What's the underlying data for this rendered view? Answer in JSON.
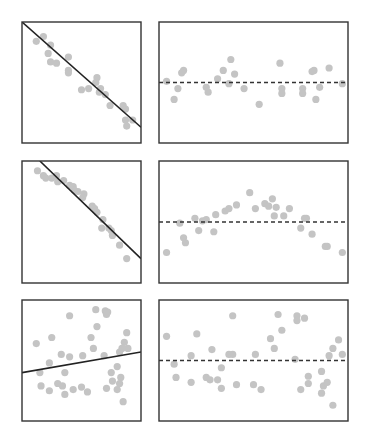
{
  "colors": {
    "point": "#c4c4c4",
    "frame": "#333333",
    "fit_line": "#222222",
    "zero_line": "#333333",
    "background": "#ffffff"
  },
  "chart_data": [
    {
      "type": "scatter",
      "panel": "row1-left",
      "title": "",
      "xlabel": "",
      "ylabel": "",
      "xlim": [
        0,
        10
      ],
      "ylim": [
        0,
        10
      ],
      "grid": false,
      "fit_line": {
        "style": "solid",
        "from": [
          0,
          10
        ],
        "to": [
          10,
          1.3
        ]
      },
      "points": [
        [
          1.2,
          8.4
        ],
        [
          1.8,
          8.8
        ],
        [
          2.4,
          8.1
        ],
        [
          2.2,
          7.4
        ],
        [
          2.4,
          6.7
        ],
        [
          2.9,
          6.6
        ],
        [
          3.9,
          7.1
        ],
        [
          3.9,
          6.0
        ],
        [
          3.9,
          5.8
        ],
        [
          5.0,
          4.4
        ],
        [
          5.6,
          4.5
        ],
        [
          6.3,
          5.4
        ],
        [
          6.2,
          5.0
        ],
        [
          6.6,
          4.5
        ],
        [
          6.5,
          4.2
        ],
        [
          7.0,
          4.0
        ],
        [
          7.4,
          3.1
        ],
        [
          8.5,
          3.1
        ],
        [
          8.7,
          2.8
        ],
        [
          8.7,
          1.9
        ],
        [
          9.3,
          1.9
        ],
        [
          8.8,
          1.4
        ]
      ]
    },
    {
      "type": "scatter",
      "panel": "row1-right",
      "title": "",
      "xlabel": "",
      "ylabel": "",
      "xlim": [
        0,
        10
      ],
      "ylim": [
        0,
        10
      ],
      "grid": false,
      "zero_line": {
        "style": "dashed",
        "y": 5.0
      },
      "points": [
        [
          0.4,
          5.1
        ],
        [
          1.3,
          6.0
        ],
        [
          1.2,
          5.8
        ],
        [
          1.0,
          4.5
        ],
        [
          0.8,
          3.6
        ],
        [
          2.5,
          4.6
        ],
        [
          2.6,
          4.2
        ],
        [
          3.1,
          5.3
        ],
        [
          3.4,
          6.0
        ],
        [
          3.8,
          6.9
        ],
        [
          4.0,
          5.7
        ],
        [
          3.7,
          4.9
        ],
        [
          4.5,
          4.5
        ],
        [
          5.3,
          3.2
        ],
        [
          6.4,
          6.6
        ],
        [
          6.5,
          4.5
        ],
        [
          6.5,
          4.1
        ],
        [
          7.6,
          4.5
        ],
        [
          7.6,
          4.1
        ],
        [
          8.1,
          5.9
        ],
        [
          8.2,
          6.0
        ],
        [
          8.3,
          3.6
        ],
        [
          8.5,
          4.6
        ],
        [
          9.0,
          6.2
        ],
        [
          9.7,
          4.9
        ]
      ]
    },
    {
      "type": "scatter",
      "panel": "row2-left",
      "title": "",
      "xlabel": "",
      "ylabel": "",
      "xlim": [
        0,
        10
      ],
      "ylim": [
        0,
        10
      ],
      "grid": false,
      "fit_line": {
        "style": "solid",
        "from": [
          1.5,
          10
        ],
        "to": [
          10,
          2.0
        ]
      },
      "points": [
        [
          1.3,
          9.2
        ],
        [
          1.8,
          8.8
        ],
        [
          2.0,
          8.6
        ],
        [
          2.5,
          8.6
        ],
        [
          2.9,
          8.8
        ],
        [
          3.0,
          8.3
        ],
        [
          3.5,
          8.4
        ],
        [
          4.0,
          8.0
        ],
        [
          4.3,
          7.9
        ],
        [
          4.4,
          7.6
        ],
        [
          4.7,
          7.5
        ],
        [
          5.2,
          7.3
        ],
        [
          5.1,
          7.0
        ],
        [
          5.9,
          6.3
        ],
        [
          6.1,
          6.1
        ],
        [
          6.3,
          5.8
        ],
        [
          6.8,
          5.2
        ],
        [
          6.7,
          4.5
        ],
        [
          7.3,
          4.5
        ],
        [
          7.5,
          4.3
        ],
        [
          7.6,
          3.9
        ],
        [
          8.2,
          3.1
        ],
        [
          8.8,
          2.0
        ]
      ]
    },
    {
      "type": "scatter",
      "panel": "row2-right",
      "title": "",
      "xlabel": "",
      "ylabel": "",
      "xlim": [
        0,
        10
      ],
      "ylim": [
        0,
        10
      ],
      "grid": false,
      "zero_line": {
        "style": "dashed",
        "y": 5.0
      },
      "points": [
        [
          0.4,
          2.5
        ],
        [
          1.1,
          4.9
        ],
        [
          1.3,
          3.7
        ],
        [
          1.4,
          3.3
        ],
        [
          1.9,
          5.3
        ],
        [
          2.1,
          4.3
        ],
        [
          2.3,
          5.1
        ],
        [
          2.5,
          5.2
        ],
        [
          3.0,
          5.6
        ],
        [
          2.9,
          4.2
        ],
        [
          3.5,
          5.9
        ],
        [
          3.7,
          6.1
        ],
        [
          4.1,
          6.4
        ],
        [
          4.8,
          7.4
        ],
        [
          5.1,
          6.1
        ],
        [
          5.6,
          6.5
        ],
        [
          5.8,
          6.3
        ],
        [
          6.0,
          6.9
        ],
        [
          6.2,
          6.2
        ],
        [
          6.1,
          5.5
        ],
        [
          6.6,
          5.5
        ],
        [
          6.9,
          6.1
        ],
        [
          7.5,
          4.5
        ],
        [
          7.7,
          5.3
        ],
        [
          7.8,
          5.3
        ],
        [
          8.1,
          4.0
        ],
        [
          8.8,
          3.0
        ],
        [
          8.9,
          3.0
        ],
        [
          9.7,
          2.5
        ]
      ]
    },
    {
      "type": "scatter",
      "panel": "row3-left",
      "title": "",
      "xlabel": "",
      "ylabel": "",
      "xlim": [
        0,
        10
      ],
      "ylim": [
        0,
        10
      ],
      "grid": false,
      "fit_line": {
        "style": "solid",
        "from": [
          0,
          4.0
        ],
        "to": [
          10,
          5.7
        ]
      },
      "points": [
        [
          1.2,
          6.4
        ],
        [
          2.5,
          6.9
        ],
        [
          4.0,
          8.7
        ],
        [
          6.2,
          9.2
        ],
        [
          7.0,
          9.1
        ],
        [
          7.2,
          9.0
        ],
        [
          7.1,
          8.8
        ],
        [
          6.3,
          7.8
        ],
        [
          5.8,
          6.9
        ],
        [
          6.0,
          6.0
        ],
        [
          8.8,
          7.3
        ],
        [
          8.6,
          6.5
        ],
        [
          8.4,
          6.0
        ],
        [
          8.9,
          6.0
        ],
        [
          8.2,
          5.7
        ],
        [
          3.3,
          5.5
        ],
        [
          4.0,
          5.3
        ],
        [
          5.1,
          5.4
        ],
        [
          2.3,
          4.8
        ],
        [
          6.9,
          5.4
        ],
        [
          1.5,
          4.0
        ],
        [
          3.6,
          4.0
        ],
        [
          8.0,
          4.5
        ],
        [
          7.5,
          4.0
        ],
        [
          8.3,
          3.6
        ],
        [
          7.6,
          3.3
        ],
        [
          8.2,
          3.1
        ],
        [
          1.6,
          2.9
        ],
        [
          2.3,
          2.5
        ],
        [
          3.0,
          3.1
        ],
        [
          3.4,
          2.9
        ],
        [
          4.3,
          2.6
        ],
        [
          5.0,
          2.8
        ],
        [
          5.5,
          2.4
        ],
        [
          7.1,
          2.7
        ],
        [
          8.0,
          2.6
        ],
        [
          3.6,
          2.2
        ],
        [
          8.5,
          1.6
        ]
      ]
    },
    {
      "type": "scatter",
      "panel": "row3-right",
      "title": "",
      "xlabel": "",
      "ylabel": "",
      "xlim": [
        0,
        10
      ],
      "ylim": [
        0,
        10
      ],
      "grid": false,
      "zero_line": {
        "style": "dashed",
        "y": 5.0
      },
      "points": [
        [
          0.4,
          7.0
        ],
        [
          0.8,
          4.7
        ],
        [
          0.9,
          3.6
        ],
        [
          1.7,
          5.4
        ],
        [
          1.7,
          3.2
        ],
        [
          2.0,
          7.2
        ],
        [
          2.5,
          3.6
        ],
        [
          2.7,
          3.4
        ],
        [
          2.8,
          5.9
        ],
        [
          3.1,
          3.4
        ],
        [
          3.3,
          4.4
        ],
        [
          3.3,
          2.7
        ],
        [
          3.9,
          8.7
        ],
        [
          3.7,
          5.5
        ],
        [
          3.9,
          5.5
        ],
        [
          4.1,
          3.0
        ],
        [
          5.0,
          3.0
        ],
        [
          5.1,
          5.5
        ],
        [
          5.4,
          2.6
        ],
        [
          5.9,
          6.8
        ],
        [
          6.1,
          6.0
        ],
        [
          6.3,
          8.8
        ],
        [
          6.5,
          7.5
        ],
        [
          7.2,
          5.1
        ],
        [
          7.3,
          8.7
        ],
        [
          7.3,
          8.3
        ],
        [
          7.7,
          8.5
        ],
        [
          7.5,
          2.6
        ],
        [
          7.9,
          3.7
        ],
        [
          7.9,
          3.1
        ],
        [
          8.6,
          4.1
        ],
        [
          8.6,
          2.3
        ],
        [
          8.7,
          2.9
        ],
        [
          8.9,
          3.2
        ],
        [
          9.0,
          5.4
        ],
        [
          9.2,
          6.0
        ],
        [
          9.5,
          6.7
        ],
        [
          9.7,
          5.5
        ],
        [
          9.2,
          1.3
        ]
      ]
    }
  ]
}
